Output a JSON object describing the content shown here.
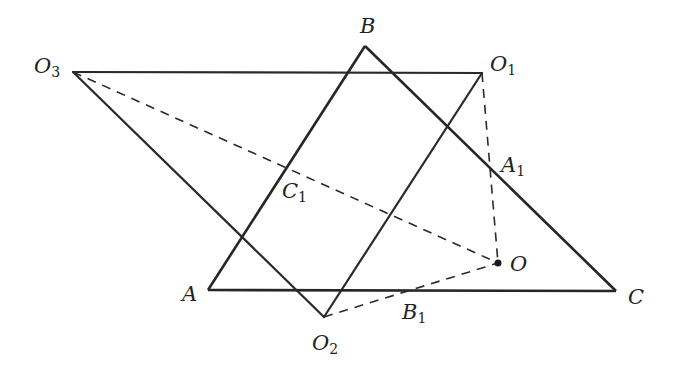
{
  "figure": {
    "points": {
      "A": {
        "label": "A",
        "sub": "",
        "x": 208,
        "y": 290,
        "lx": 182,
        "ly": 284
      },
      "B": {
        "label": "B",
        "sub": "",
        "x": 365,
        "y": 46,
        "lx": 360,
        "ly": 16
      },
      "C": {
        "label": "C",
        "sub": "",
        "x": 616,
        "y": 291,
        "lx": 628,
        "ly": 287
      },
      "O": {
        "label": "O",
        "sub": "",
        "x": 498,
        "y": 263,
        "lx": 510,
        "ly": 254
      },
      "O1": {
        "label": "O",
        "sub": "1",
        "x": 482,
        "y": 73,
        "lx": 490,
        "ly": 54
      },
      "O2": {
        "label": "O",
        "sub": "2",
        "x": 324,
        "y": 317,
        "lx": 312,
        "ly": 333
      },
      "O3": {
        "label": "O",
        "sub": "3",
        "x": 73,
        "y": 72,
        "lx": 34,
        "ly": 56
      },
      "A1": {
        "label": "A",
        "sub": "1",
        "x": 490,
        "y": 168,
        "lx": 501,
        "ly": 155
      },
      "B1": {
        "label": "B",
        "sub": "1",
        "x": 410,
        "y": 290,
        "lx": 402,
        "ly": 302
      },
      "C1": {
        "label": "C",
        "sub": "1",
        "x": 286,
        "y": 169,
        "lx": 282,
        "ly": 181
      }
    },
    "segments_thick": [
      [
        "A",
        "B"
      ],
      [
        "B",
        "C"
      ],
      [
        "C",
        "A"
      ]
    ],
    "segments_solid": [
      [
        "O3",
        "O1"
      ],
      [
        "O1",
        "O2"
      ],
      [
        "O2",
        "O3"
      ]
    ],
    "segments_dashed": [
      [
        "O3",
        "O"
      ],
      [
        "O1",
        "O"
      ],
      [
        "O2",
        "O"
      ]
    ],
    "dot": "O"
  }
}
